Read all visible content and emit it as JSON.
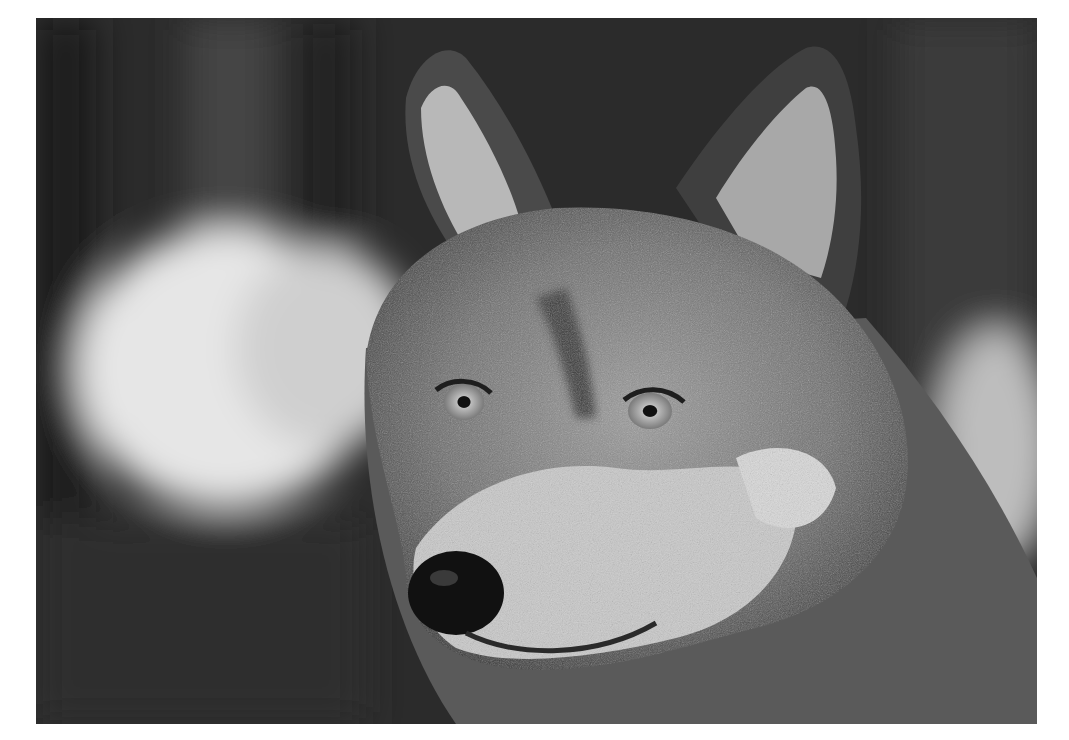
{
  "image": {
    "subject": "Grayscale close-up portrait of a gray wolf",
    "alt": "Black-and-white photograph of a wolf's head looking toward the left, with blurred dark forest background and a bright blurred patch on the left"
  }
}
